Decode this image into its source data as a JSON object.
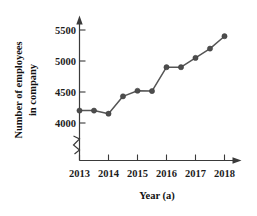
{
  "chart_data": {
    "type": "line",
    "title": "",
    "xlabel": "Year (a)",
    "ylabel": "Number of employees in company",
    "ylabel_line1": "Number of employees",
    "ylabel_line2": "in company",
    "x": [
      2013,
      2013.5,
      2014,
      2014.5,
      2015,
      2015.5,
      2016,
      2016.5,
      2017,
      2017.5,
      2018
    ],
    "values": [
      4200,
      4200,
      4150,
      4430,
      4520,
      4515,
      4900,
      4900,
      5050,
      5200,
      5400
    ],
    "series": [
      {
        "name": "Number of employees in company",
        "values": [
          4200,
          4200,
          4150,
          4430,
          4520,
          4515,
          4900,
          4900,
          5050,
          5200,
          5400
        ]
      }
    ],
    "xtick_labels": [
      "2013",
      "2014",
      "2015",
      "2016",
      "2017",
      "2018"
    ],
    "xtick_values": [
      2013,
      2014,
      2015,
      2016,
      2017,
      2018
    ],
    "ytick_labels": [
      "4000",
      "4500",
      "5000",
      "5500"
    ],
    "ytick_values": [
      4000,
      4500,
      5000,
      5500
    ],
    "ylim": [
      4000,
      5500
    ],
    "xlim": [
      2013,
      2018
    ],
    "axis_break": true,
    "axis_break_axis": "y",
    "grid": false,
    "legend": false,
    "marker": "circle",
    "line_color": "#555555",
    "marker_color": "#4d4d4d",
    "axis_color": "#3a3a3a",
    "background_color": "#ffffff"
  }
}
